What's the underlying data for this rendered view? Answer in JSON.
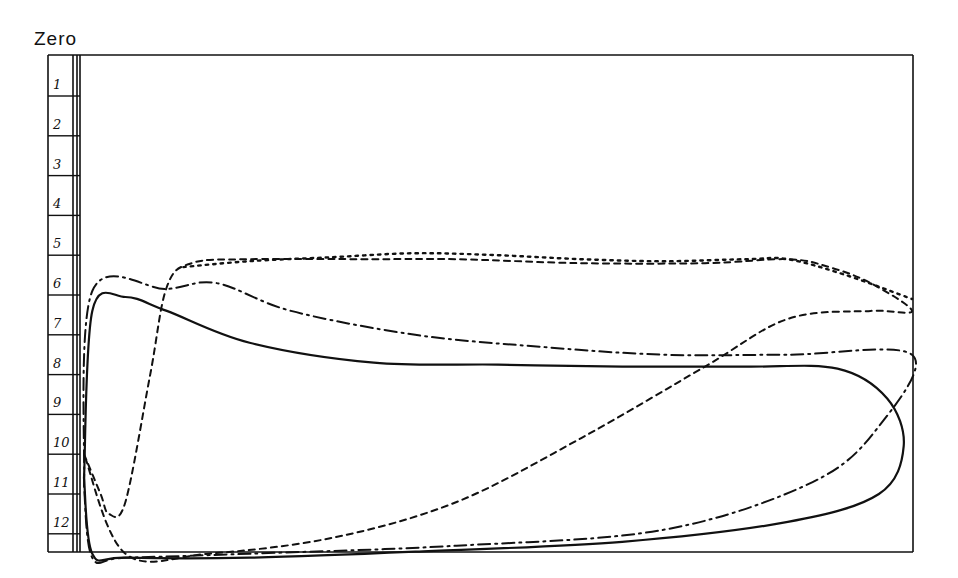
{
  "chart_data": {
    "type": "line",
    "title": "Zero",
    "xlabel": "",
    "ylabel": "",
    "grid": false,
    "legend": null,
    "y_axis": {
      "orientation": "inverted",
      "tick_labels": [
        "1",
        "2",
        "3",
        "4",
        "5",
        "6",
        "7",
        "8",
        "9",
        "10",
        "11",
        "12"
      ],
      "range": [
        0,
        12.5
      ]
    },
    "x_range": [
      0,
      1
    ],
    "series": [
      {
        "name": "solid",
        "style": "solid",
        "points": [
          [
            0.0,
            10.6
          ],
          [
            0.01,
            6.4
          ],
          [
            0.05,
            6.05
          ],
          [
            0.1,
            6.4
          ],
          [
            0.2,
            7.2
          ],
          [
            0.35,
            7.7
          ],
          [
            0.5,
            7.75
          ],
          [
            0.65,
            7.8
          ],
          [
            0.8,
            7.8
          ],
          [
            0.91,
            7.85
          ],
          [
            0.97,
            8.6
          ],
          [
            0.99,
            9.8
          ],
          [
            0.96,
            11.0
          ],
          [
            0.85,
            11.7
          ],
          [
            0.65,
            12.2
          ],
          [
            0.4,
            12.45
          ],
          [
            0.2,
            12.6
          ],
          [
            0.05,
            12.6
          ],
          [
            0.01,
            12.5
          ],
          [
            0.0,
            10.6
          ]
        ]
      },
      {
        "name": "dash-dot",
        "style": "dashdot",
        "points": [
          [
            0.0,
            10.8
          ],
          [
            0.01,
            5.9
          ],
          [
            0.1,
            5.85
          ],
          [
            0.16,
            5.7
          ],
          [
            0.25,
            6.4
          ],
          [
            0.4,
            7.0
          ],
          [
            0.55,
            7.3
          ],
          [
            0.7,
            7.5
          ],
          [
            0.85,
            7.5
          ],
          [
            1.0,
            7.5
          ],
          [
            0.96,
            9.3
          ],
          [
            0.88,
            10.7
          ],
          [
            0.7,
            11.9
          ],
          [
            0.45,
            12.3
          ],
          [
            0.2,
            12.5
          ],
          [
            0.05,
            12.6
          ],
          [
            0.01,
            12.6
          ],
          [
            0.0,
            10.8
          ]
        ]
      },
      {
        "name": "dashed",
        "style": "dashed",
        "points": [
          [
            0.0,
            10.0
          ],
          [
            0.02,
            11.0
          ],
          [
            0.03,
            11.5
          ],
          [
            0.05,
            11.2
          ],
          [
            0.08,
            8.0
          ],
          [
            0.1,
            5.8
          ],
          [
            0.13,
            5.2
          ],
          [
            0.2,
            5.1
          ],
          [
            0.35,
            5.1
          ],
          [
            0.45,
            5.1
          ],
          [
            0.6,
            5.2
          ],
          [
            0.75,
            5.2
          ],
          [
            0.85,
            5.1
          ],
          [
            0.9,
            5.3
          ],
          [
            0.95,
            5.7
          ],
          [
            1.0,
            6.4
          ],
          [
            0.95,
            6.4
          ],
          [
            0.85,
            6.6
          ],
          [
            0.75,
            7.8
          ],
          [
            0.6,
            9.6
          ],
          [
            0.45,
            11.2
          ],
          [
            0.3,
            12.1
          ],
          [
            0.15,
            12.5
          ],
          [
            0.05,
            12.5
          ],
          [
            0.0,
            10.0
          ]
        ]
      },
      {
        "name": "dotted",
        "style": "dotted",
        "points": [
          [
            0.12,
            5.3
          ],
          [
            0.2,
            5.15
          ],
          [
            0.3,
            5.05
          ],
          [
            0.4,
            4.95
          ],
          [
            0.5,
            5.0
          ],
          [
            0.6,
            5.1
          ],
          [
            0.7,
            5.15
          ],
          [
            0.8,
            5.1
          ],
          [
            0.85,
            5.1
          ],
          [
            0.92,
            5.5
          ],
          [
            1.0,
            6.1
          ]
        ]
      }
    ]
  },
  "labels": {
    "title": "Zero",
    "ticks": [
      "1",
      "2",
      "3",
      "4",
      "5",
      "6",
      "7",
      "8",
      "9",
      "10",
      "11",
      "12"
    ]
  }
}
